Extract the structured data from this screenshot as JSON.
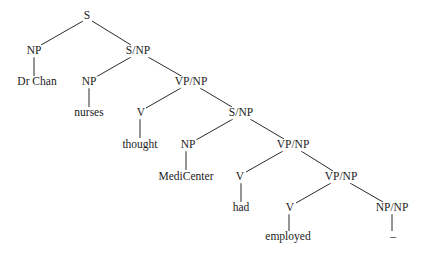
{
  "diagram": {
    "type": "syntax-tree",
    "line_color": "#2a2a2a",
    "text_color": "#222222",
    "nodes": [
      {
        "id": "n0",
        "label": "S",
        "x": 87,
        "y": 16,
        "kind": "category"
      },
      {
        "id": "n1",
        "label": "NP",
        "x": 34,
        "y": 51,
        "kind": "category"
      },
      {
        "id": "n2",
        "label": "Dr Chan",
        "x": 37,
        "y": 82,
        "kind": "word"
      },
      {
        "id": "n3",
        "label": "S/NP",
        "x": 138,
        "y": 51,
        "kind": "category"
      },
      {
        "id": "n4",
        "label": "NP",
        "x": 89,
        "y": 82,
        "kind": "category"
      },
      {
        "id": "n5",
        "label": "nurses",
        "x": 89,
        "y": 113,
        "kind": "word"
      },
      {
        "id": "n6",
        "label": "VP/NP",
        "x": 191,
        "y": 82,
        "kind": "category"
      },
      {
        "id": "n7",
        "label": "V",
        "x": 141,
        "y": 113,
        "kind": "category"
      },
      {
        "id": "n8",
        "label": "thought",
        "x": 140,
        "y": 145,
        "kind": "word"
      },
      {
        "id": "n9",
        "label": "S/NP",
        "x": 241,
        "y": 113,
        "kind": "category"
      },
      {
        "id": "n10",
        "label": "NP",
        "x": 188,
        "y": 145,
        "kind": "category"
      },
      {
        "id": "n11",
        "label": "MediCenter",
        "x": 186,
        "y": 177,
        "kind": "word"
      },
      {
        "id": "n12",
        "label": "VP/NP",
        "x": 293,
        "y": 145,
        "kind": "category"
      },
      {
        "id": "n13",
        "label": "V",
        "x": 240,
        "y": 177,
        "kind": "category"
      },
      {
        "id": "n14",
        "label": "had",
        "x": 241,
        "y": 208,
        "kind": "word"
      },
      {
        "id": "n15",
        "label": "VP/NP",
        "x": 341,
        "y": 177,
        "kind": "category"
      },
      {
        "id": "n16",
        "label": "V",
        "x": 290,
        "y": 208,
        "kind": "category"
      },
      {
        "id": "n17",
        "label": "employed",
        "x": 288,
        "y": 237,
        "kind": "word"
      },
      {
        "id": "n18",
        "label": "NP/NP",
        "x": 392,
        "y": 208,
        "kind": "category"
      },
      {
        "id": "n19",
        "label": "–",
        "x": 393,
        "y": 237,
        "kind": "gap"
      }
    ],
    "edges": [
      {
        "from": "n0",
        "to": "n1",
        "x1": 83,
        "y1": 21,
        "x2": 41,
        "y2": 45
      },
      {
        "from": "n0",
        "to": "n3",
        "x1": 92,
        "y1": 21,
        "x2": 131,
        "y2": 45
      },
      {
        "from": "n1",
        "to": "n2",
        "x1": 34,
        "y1": 57,
        "x2": 34,
        "y2": 76
      },
      {
        "from": "n3",
        "to": "n4",
        "x1": 131,
        "y1": 57,
        "x2": 96,
        "y2": 77
      },
      {
        "from": "n3",
        "to": "n6",
        "x1": 148,
        "y1": 57,
        "x2": 183,
        "y2": 77
      },
      {
        "from": "n4",
        "to": "n5",
        "x1": 89,
        "y1": 88,
        "x2": 89,
        "y2": 107
      },
      {
        "from": "n6",
        "to": "n7",
        "x1": 181,
        "y1": 88,
        "x2": 146,
        "y2": 108
      },
      {
        "from": "n6",
        "to": "n9",
        "x1": 200,
        "y1": 88,
        "x2": 232,
        "y2": 107
      },
      {
        "from": "n7",
        "to": "n8",
        "x1": 140,
        "y1": 119,
        "x2": 140,
        "y2": 138
      },
      {
        "from": "n9",
        "to": "n10",
        "x1": 233,
        "y1": 119,
        "x2": 196,
        "y2": 140
      },
      {
        "from": "n9",
        "to": "n12",
        "x1": 250,
        "y1": 119,
        "x2": 284,
        "y2": 139
      },
      {
        "from": "n10",
        "to": "n11",
        "x1": 186,
        "y1": 151,
        "x2": 186,
        "y2": 170
      },
      {
        "from": "n12",
        "to": "n13",
        "x1": 283,
        "y1": 151,
        "x2": 246,
        "y2": 172
      },
      {
        "from": "n12",
        "to": "n15",
        "x1": 301,
        "y1": 151,
        "x2": 333,
        "y2": 171
      },
      {
        "from": "n13",
        "to": "n14",
        "x1": 241,
        "y1": 183,
        "x2": 241,
        "y2": 202
      },
      {
        "from": "n15",
        "to": "n16",
        "x1": 331,
        "y1": 183,
        "x2": 296,
        "y2": 203
      },
      {
        "from": "n15",
        "to": "n18",
        "x1": 350,
        "y1": 183,
        "x2": 383,
        "y2": 202
      },
      {
        "from": "n16",
        "to": "n17",
        "x1": 289,
        "y1": 214,
        "x2": 289,
        "y2": 231
      },
      {
        "from": "n18",
        "to": "n19",
        "x1": 392,
        "y1": 214,
        "x2": 392,
        "y2": 231
      }
    ]
  }
}
